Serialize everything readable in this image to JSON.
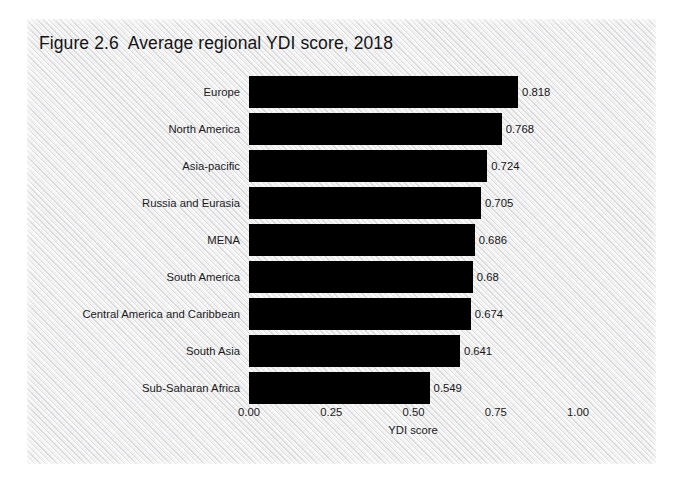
{
  "figure": {
    "title": "Figure 2.6  Average regional YDI score, 2018",
    "panel_color": "#ededee",
    "bar_color": "#000000",
    "text_color": "#1b1b1b"
  },
  "chart_data": {
    "type": "bar",
    "orientation": "horizontal",
    "title": "Figure 2.6  Average regional YDI score, 2018",
    "xlabel": "YDI score",
    "ylabel": "",
    "xlim": [
      0,
      1
    ],
    "xticks": [
      "0.00",
      "0.25",
      "0.50",
      "0.75",
      "1.00"
    ],
    "xtick_values": [
      0,
      0.25,
      0.5,
      0.75,
      1
    ],
    "grid": false,
    "legend": null,
    "categories": [
      "Europe",
      "North America",
      "Asia-pacific",
      "Russia and Eurasia",
      "MENA",
      "South America",
      "Central America and Caribbean",
      "South Asia",
      "Sub-Saharan Africa"
    ],
    "values": [
      0.818,
      0.768,
      0.724,
      0.705,
      0.686,
      0.68,
      0.674,
      0.641,
      0.549
    ],
    "value_labels": [
      "0.818",
      "0.768",
      "0.724",
      "0.705",
      "0.686",
      "0.68",
      "0.674",
      "0.641",
      "0.549"
    ]
  }
}
